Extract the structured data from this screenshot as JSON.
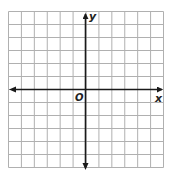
{
  "diagram": {
    "type": "coordinate-grid",
    "grid": {
      "columns": 12,
      "rows": 12,
      "line_color": "#b0b0b0",
      "origin_col": 6,
      "origin_row": 6
    },
    "axes": {
      "x_label": "x",
      "y_label": "y",
      "origin_label": "O",
      "axis_color": "#1a1a1a",
      "arrows": "both-ends"
    }
  }
}
